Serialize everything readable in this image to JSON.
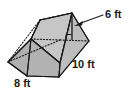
{
  "figure": {
    "kind": "triangular-prism",
    "caption": "Triangular prism with labeled base, length and height",
    "colors": {
      "background": "#ffffff",
      "face_front": "#b5b5b5",
      "face_top": "#c4c4c4",
      "face_left": "#aeaeae",
      "outline": "#1a1a1a",
      "label_text": "#1a1a1a"
    },
    "labels": {
      "height": "6 ft",
      "length": "10 ft",
      "base": "8 ft"
    },
    "label_positions": {
      "height": {
        "x": 106,
        "y": 15
      },
      "length": {
        "x": 74,
        "y": 65
      },
      "base": {
        "x": 14,
        "y": 82
      }
    },
    "measurements": [
      {
        "name": "height",
        "value": 6,
        "unit": "ft",
        "text": "6 ft"
      },
      {
        "name": "length",
        "value": 10,
        "unit": "ft",
        "text": "10 ft"
      },
      {
        "name": "base",
        "value": 8,
        "unit": "ft",
        "text": "8 ft"
      }
    ],
    "geometry": {
      "front_triangle": "72,13 89,41 60,63",
      "top_face": "72,13 60,63 31,39 40,20",
      "left_face": "31,39 60,63 27,76 8,62",
      "front_face": "60,63 89,41 59,77 27,76",
      "hidden_edges": [
        "40,20 31,39",
        "31,39 8,62",
        "8,62 27,76",
        "31,39 60,63",
        "40,20 72,13",
        "60,63 89,41"
      ],
      "height_segment": "72,13 72,40",
      "base_hidden_segment": "60,40 89,40",
      "right_angle_marker": "66,40 66,34 72,34",
      "leader_line": "78,24 103,16",
      "arrow_tip": "76,26"
    }
  }
}
